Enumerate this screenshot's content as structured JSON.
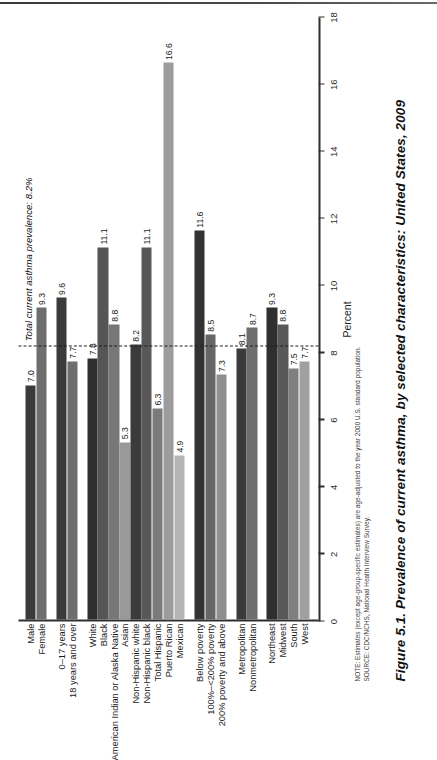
{
  "figure": {
    "number": "Figure 5.1.",
    "caption": "Prevalence of current asthma, by selected characteristics: United States, 2009"
  },
  "notes": {
    "note": "NOTE: Estimates (except age-group-specific estimates) are age-adjusted to the year 2000 U.S. standard population.",
    "source": "SOURCE: CDC/NCHS, National Health Interview Survey."
  },
  "annotation": {
    "reference_label": "Total current asthma prevalence: 8.2%",
    "reference_value": 8.2
  },
  "chart_data": {
    "type": "bar",
    "title": "Prevalence of current asthma, by selected characteristics: United States, 2009",
    "xlabel": "Percent",
    "ylabel": "",
    "xlim": [
      0,
      18
    ],
    "xticks": [
      0,
      2,
      4,
      6,
      8,
      10,
      12,
      14,
      16,
      18
    ],
    "grid": false,
    "legend": false,
    "orientation": "horizontal",
    "reference_line": 8.2,
    "groups": [
      {
        "name": "Sex",
        "categories": [
          "Male",
          "Female"
        ],
        "values": [
          7.0,
          9.3
        ],
        "labels": [
          "7.0",
          "9.3"
        ],
        "colors": [
          "#3b3b3b",
          "#6e6e6e"
        ]
      },
      {
        "name": "Age",
        "categories": [
          "0–17 years",
          "18 years and over"
        ],
        "values": [
          9.6,
          7.7
        ],
        "labels": [
          "9.6",
          "7.7"
        ],
        "colors": [
          "#3b3b3b",
          "#6e6e6e"
        ]
      },
      {
        "name": "Race and ethnicity",
        "categories": [
          "White",
          "Black",
          "American Indian or Alaska Native",
          "Asian",
          "Non-Hispanic white",
          "Non-Hispanic black",
          "Total Hispanic",
          "Puerto Rican",
          "Mexican"
        ],
        "values": [
          7.8,
          11.1,
          8.8,
          5.3,
          8.2,
          11.1,
          6.3,
          16.6,
          4.9
        ],
        "labels": [
          "7.8",
          "11.1",
          "8.8",
          "5.3",
          "8.2",
          "11.1",
          "6.3",
          "16.6",
          "4.9"
        ],
        "colors": [
          "#2f2f2f",
          "#555555",
          "#777777",
          "#999999",
          "#3b3b3b",
          "#585858",
          "#7a7a7a",
          "#9c9c9c",
          "#b5b5b5"
        ]
      },
      {
        "name": "Poverty status",
        "categories": [
          "Below poverty",
          "100%–<200% poverty",
          "200% poverty and above"
        ],
        "values": [
          11.6,
          8.5,
          7.3
        ],
        "labels": [
          "11.6",
          "8.5",
          "7.3"
        ],
        "colors": [
          "#333333",
          "#666666",
          "#8f8f8f"
        ]
      },
      {
        "name": "Urbanization",
        "categories": [
          "Metropolitan",
          "Nonmetropolitan"
        ],
        "values": [
          8.1,
          8.7
        ],
        "labels": [
          "8.1",
          "8.7"
        ],
        "colors": [
          "#3b3b3b",
          "#6e6e6e"
        ]
      },
      {
        "name": "Region",
        "categories": [
          "Northeast",
          "Midwest",
          "South",
          "West"
        ],
        "values": [
          9.3,
          8.8,
          7.5,
          7.7
        ],
        "labels": [
          "9.3",
          "8.8",
          "7.5",
          "7.7"
        ],
        "colors": [
          "#2f2f2f",
          "#585858",
          "#7f7f7f",
          "#a0a0a0"
        ]
      }
    ]
  }
}
